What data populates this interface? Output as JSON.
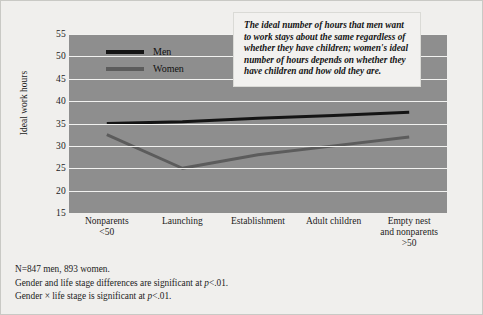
{
  "chart_data": {
    "type": "line",
    "title": "",
    "xlabel": "",
    "ylabel": "Ideal work hours",
    "ylim": [
      15,
      55
    ],
    "yticks": [
      55,
      50,
      45,
      40,
      35,
      30,
      25,
      20,
      15
    ],
    "grid": true,
    "legend_position": "inside-top-left",
    "categories": [
      "Nonparents\n<50",
      "Launching",
      "Establishment",
      "Adult children",
      "Empty nest\nand nonparents\n>50"
    ],
    "series": [
      {
        "name": "Men",
        "values": [
          35.0,
          35.4,
          36.2,
          36.8,
          37.5
        ],
        "color": "#141414"
      },
      {
        "name": "Women",
        "values": [
          32.5,
          25.0,
          28.0,
          30.0,
          32.0
        ],
        "color": "#5c5c5c"
      }
    ],
    "annotations": [
      "The ideal number of hours that men want to work stays about the same regardless of whether they have children; women's ideal number of hours depends on whether they have children and how old they are."
    ]
  },
  "legend": {
    "items": [
      {
        "label": "Men",
        "color": "#141414"
      },
      {
        "label": "Women",
        "color": "#5c5c5c"
      }
    ]
  },
  "callout": {
    "text": "The ideal number of hours that men want to work stays about the same regardless of whether they have children; women's ideal number of hours depends on whether they have children and how old they are."
  },
  "footnotes": [
    "N=847 men, 893 women.",
    "Gender and life stage differences are significant at p<.01.",
    "Gender × life stage is significant at p<.01."
  ],
  "colors": {
    "plot_background": "#8e8e8e",
    "figure_background": "#f0efed",
    "gridline": "#f2f2f0",
    "men_line": "#141414",
    "women_line": "#5c5c5c"
  }
}
